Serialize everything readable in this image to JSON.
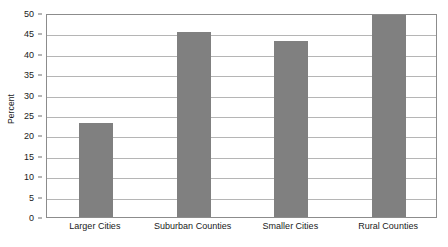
{
  "chart_data": {
    "type": "bar",
    "title": "",
    "xlabel": "",
    "ylabel": "Percent",
    "ylim": [
      0,
      50
    ],
    "yticks": [
      0,
      5,
      10,
      15,
      20,
      25,
      30,
      35,
      40,
      45,
      50
    ],
    "ytick_labels": [
      "0",
      "5",
      "10",
      "15",
      "20",
      "25",
      "30",
      "35",
      "40",
      "45",
      "50"
    ],
    "grid": true,
    "legend": false,
    "legend_position": "none",
    "categories": [
      "Larger Cities",
      "Suburban Counties",
      "Smaller Cities",
      "Rural Counties"
    ],
    "values": [
      23.0,
      45.3,
      43.2,
      49.5
    ],
    "bar_color": "#808080",
    "gridline_color": "#b5b5b5",
    "axis_color": "#8c8c8c",
    "background_color": "#ffffff",
    "text_color": "#1a1a1a"
  }
}
